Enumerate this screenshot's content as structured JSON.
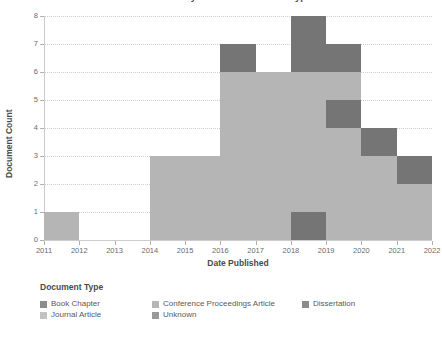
{
  "chart_data": {
    "type": "bar",
    "title": "Documents by Year and Document Type",
    "xlabel": "Date Published",
    "ylabel": "Document Count",
    "ylim": [
      0,
      8
    ],
    "yticks": [
      0,
      1,
      2,
      3,
      4,
      5,
      6,
      7,
      8
    ],
    "ytick_labels": [
      "0",
      "1",
      "2",
      "3",
      "4",
      "5",
      "6",
      "7",
      "8"
    ],
    "xticks": [
      2011,
      2012,
      2013,
      2014,
      2015,
      2016,
      2017,
      2018,
      2019,
      2020,
      2021,
      2022
    ],
    "xtick_labels": [
      "2011",
      "2012",
      "2013",
      "2014",
      "2015",
      "2016",
      "2017",
      "2018",
      "2019",
      "2020",
      "2021",
      "2022"
    ],
    "grid": true,
    "stacked": true,
    "legend_position": "bottom-left",
    "legend_title": "Document Type",
    "categories": [
      "2011",
      "2012",
      "2013",
      "2014",
      "2015",
      "2016",
      "2017",
      "2018",
      "2019",
      "2020",
      "2021"
    ],
    "totals": [
      1,
      0,
      0,
      3,
      3,
      7,
      6,
      8,
      7,
      4,
      3
    ],
    "bars": [
      {
        "year": "2011",
        "total": 1,
        "segments": [
          {
            "shade": "light",
            "from": 0,
            "to": 1
          }
        ]
      },
      {
        "year": "2012",
        "total": 0,
        "segments": []
      },
      {
        "year": "2013",
        "total": 0,
        "segments": []
      },
      {
        "year": "2014",
        "total": 3,
        "segments": [
          {
            "shade": "light",
            "from": 0,
            "to": 3
          }
        ]
      },
      {
        "year": "2015",
        "total": 3,
        "segments": [
          {
            "shade": "light",
            "from": 0,
            "to": 3
          }
        ]
      },
      {
        "year": "2016",
        "total": 7,
        "segments": [
          {
            "shade": "light",
            "from": 0,
            "to": 6
          },
          {
            "shade": "dark",
            "from": 6,
            "to": 7
          }
        ]
      },
      {
        "year": "2017",
        "total": 6,
        "segments": [
          {
            "shade": "light",
            "from": 0,
            "to": 6
          }
        ]
      },
      {
        "year": "2018",
        "total": 8,
        "segments": [
          {
            "shade": "dark",
            "from": 0,
            "to": 1
          },
          {
            "shade": "light",
            "from": 1,
            "to": 6
          },
          {
            "shade": "dark",
            "from": 6,
            "to": 8
          }
        ]
      },
      {
        "year": "2019",
        "total": 7,
        "segments": [
          {
            "shade": "light",
            "from": 0,
            "to": 4
          },
          {
            "shade": "dark",
            "from": 4,
            "to": 5
          },
          {
            "shade": "light",
            "from": 5,
            "to": 6
          },
          {
            "shade": "dark",
            "from": 6,
            "to": 7
          }
        ]
      },
      {
        "year": "2020",
        "total": 4,
        "segments": [
          {
            "shade": "light",
            "from": 0,
            "to": 3
          },
          {
            "shade": "dark",
            "from": 3,
            "to": 4
          }
        ]
      },
      {
        "year": "2021",
        "total": 3,
        "segments": [
          {
            "shade": "light",
            "from": 0,
            "to": 2
          },
          {
            "shade": "dark",
            "from": 2,
            "to": 3
          }
        ]
      }
    ],
    "series": [
      {
        "name": "Book Chapter",
        "swatch": "#8c8c8c"
      },
      {
        "name": "Conference Proceedings Article",
        "swatch": "#b5b5b5"
      },
      {
        "name": "Dissertation",
        "swatch": "#8c8c8c"
      },
      {
        "name": "Journal Article",
        "swatch": "#c2c2c2"
      },
      {
        "name": "Unknown",
        "swatch": "#9a9a9a"
      }
    ]
  },
  "colors": {
    "bar_light": "#b5b5b5",
    "bar_dark": "#757575",
    "grid": "#cfcfcf",
    "axis": "#c8c8c8",
    "text": "#4a4a4a",
    "tick_text": "#6b6b6b",
    "background": "#ffffff"
  },
  "legend": {
    "title": "Document Type",
    "items": [
      {
        "label": "Book Chapter",
        "swatch": "#8c8c8c"
      },
      {
        "label": "Conference Proceedings Article",
        "swatch": "#b5b5b5"
      },
      {
        "label": "Dissertation",
        "swatch": "#8c8c8c"
      },
      {
        "label": "Journal Article",
        "swatch": "#c2c2c2"
      },
      {
        "label": "Unknown",
        "swatch": "#9a9a9a"
      }
    ]
  }
}
